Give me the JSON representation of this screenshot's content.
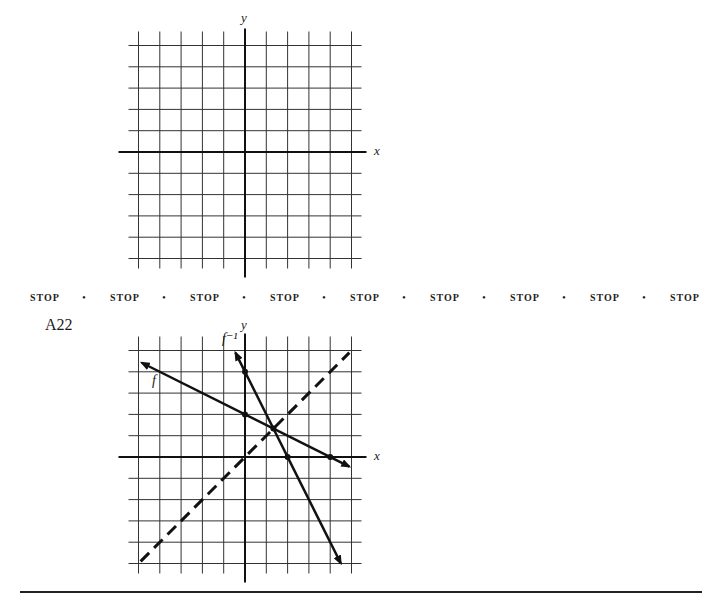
{
  "top_graph": {
    "x_label": "x",
    "y_label": "y",
    "grid_units": {
      "x_min": -5,
      "x_max": 5,
      "y_min": -5,
      "y_max": 5
    }
  },
  "stop_row": {
    "items": [
      "STOP",
      "STOP",
      "STOP",
      "STOP",
      "STOP",
      "STOP",
      "STOP",
      "STOP",
      "STOP"
    ],
    "separator": "•"
  },
  "answer": {
    "label": "A22",
    "x_label": "x",
    "y_label": "y",
    "f_label": "f",
    "f_inverse_label": "f⁻¹"
  },
  "chart_data": [
    {
      "type": "line",
      "title": "",
      "xlabel": "x",
      "ylabel": "y",
      "xlim": [
        -5,
        5
      ],
      "ylim": [
        -5,
        5
      ],
      "grid": true,
      "series": []
    },
    {
      "type": "line",
      "title": "A22",
      "xlabel": "x",
      "ylabel": "y",
      "xlim": [
        -5,
        5
      ],
      "ylim": [
        -5,
        5
      ],
      "grid": true,
      "series": [
        {
          "name": "f",
          "equation": "y = 2 - x/2",
          "points": [
            [
              -5,
              4.5
            ],
            [
              0,
              2
            ],
            [
              4,
              0
            ],
            [
              5,
              -0.5
            ]
          ],
          "style": "solid, arrows both ends"
        },
        {
          "name": "f^-1",
          "equation": "y = 4 - 2x",
          "points": [
            [
              -0.5,
              5
            ],
            [
              0,
              4
            ],
            [
              2,
              0
            ],
            [
              4.5,
              -5
            ]
          ],
          "style": "solid, arrows both ends"
        },
        {
          "name": "y = x",
          "points": [
            [
              -5,
              -5
            ],
            [
              5,
              5
            ]
          ],
          "style": "dashed"
        }
      ],
      "marked_points": [
        [
          0,
          2
        ],
        [
          4,
          0
        ],
        [
          0,
          4
        ],
        [
          2,
          0
        ],
        [
          1.333,
          1.333
        ]
      ]
    }
  ]
}
